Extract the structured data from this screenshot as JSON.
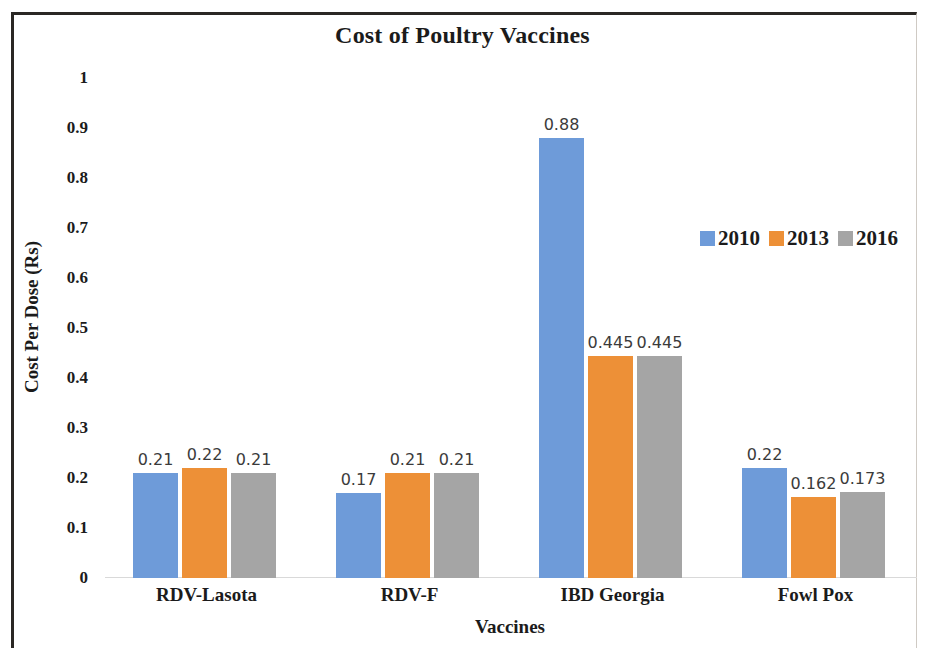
{
  "chart_data": {
    "type": "bar",
    "title": "Cost of Poultry Vaccines",
    "xlabel": "Vaccines",
    "ylabel": "Cost Per Dose (Rs)",
    "categories": [
      "RDV-Lasota",
      "RDV-F",
      "IBD Georgia",
      "Fowl Pox"
    ],
    "series": [
      {
        "name": "2010",
        "color": "#6E9BD9",
        "values": [
          0.21,
          0.17,
          0.88,
          0.22
        ],
        "labels": [
          "0.21",
          "0.17",
          "0.88",
          "0.22"
        ]
      },
      {
        "name": "2013",
        "color": "#ED9037",
        "values": [
          0.22,
          0.21,
          0.445,
          0.162
        ],
        "labels": [
          "0.22",
          "0.21",
          "0.445",
          "0.162"
        ]
      },
      {
        "name": "2016",
        "color": "#A5A5A5",
        "values": [
          0.21,
          0.21,
          0.445,
          0.173
        ],
        "labels": [
          "0.21",
          "0.21",
          "0.445",
          "0.173"
        ]
      }
    ],
    "ylim": [
      0,
      1
    ],
    "yticks": [
      "1",
      "0.9",
      "0.8",
      "0.7",
      "0.6",
      "0.5",
      "0.4",
      "0.3",
      "0.2",
      "0.1",
      "0"
    ],
    "ytick_values": [
      1,
      0.9,
      0.8,
      0.7,
      0.6,
      0.5,
      0.4,
      0.3,
      0.2,
      0.1,
      0
    ],
    "grid": false,
    "legend_position": "middle-right",
    "data_labels_shown": true
  }
}
